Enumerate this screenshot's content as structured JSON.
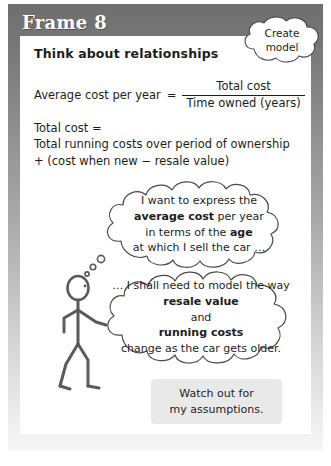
{
  "frame": {
    "title": "Frame 8"
  },
  "card": {
    "heading": "Think about relationships",
    "equation": {
      "lhs": "Average cost per year",
      "equals": "=",
      "numerator": "Total cost",
      "denominator": "Time owned (years)"
    },
    "total_cost": {
      "line1": "Total cost =",
      "line2": "Total running costs over period of ownership",
      "line3": "+ (cost when new − resale value)"
    }
  },
  "create_cloud": {
    "line1": "Create",
    "line2": "model"
  },
  "thought_one": {
    "line1": "I want to express the",
    "line2_bold": "average cost",
    "line2_rest": " per year",
    "line3_pre": "in terms of the ",
    "line3_bold": "age",
    "line4": "at which I sell the car …"
  },
  "thought_two": {
    "line1": "… I shall need to model the way",
    "line2_bold": "resale value",
    "line3": "and",
    "line4_bold": "running costs",
    "line5": "change as the car gets older."
  },
  "assumptions": {
    "line1": "Watch out for",
    "line2": "my assumptions."
  },
  "colors": {
    "frame_top": "#6e6e6e",
    "frame_bottom": "#f6f6f6",
    "card_bg": "#ffffff",
    "ink": "#1d1d1d",
    "assume_box_bg": "#e9e9e9",
    "title_text": "#ffffff"
  }
}
